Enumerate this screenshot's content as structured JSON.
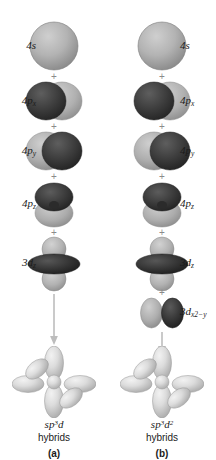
{
  "figure": {
    "plus_symbol": "+",
    "colors": {
      "background": "#ffffff",
      "lobe_light": "#b9b9b9",
      "lobe_dark": "#3a3a3a",
      "hybrid": "#d7d7d7",
      "arrow": "#bdbdbd",
      "text": "#1b1b1b",
      "plus": "#8b8b8b"
    }
  },
  "columns": [
    {
      "id": "a",
      "label_side": "left",
      "panel_letter": "(a)",
      "hybrid_name": "sp",
      "hybrid_sup1": "3",
      "hybrid_tail": "d",
      "hybrid_sup2": "",
      "hybrid_word": "hybrids",
      "orbitals": [
        {
          "name": "4s",
          "sub": "",
          "subsup": "",
          "shape": "s",
          "top": 18
        },
        {
          "name": "4p",
          "sub": "x",
          "subsup": "",
          "shape": "px",
          "top": 78
        },
        {
          "name": "4p",
          "sub": "y",
          "subsup": "",
          "shape": "py",
          "top": 128
        },
        {
          "name": "4p",
          "sub": "z",
          "subsup": "",
          "shape": "pz",
          "top": 180
        },
        {
          "name": "3d",
          "sub": "z",
          "subsup": "2",
          "shape": "dz2",
          "top": 236
        }
      ]
    },
    {
      "id": "b",
      "label_side": "right",
      "panel_letter": "(b)",
      "hybrid_name": "sp",
      "hybrid_sup1": "3",
      "hybrid_tail": "d",
      "hybrid_sup2": "2",
      "hybrid_word": "hybrids",
      "orbitals": [
        {
          "name": "4s",
          "sub": "",
          "subsup": "",
          "shape": "s",
          "top": 18
        },
        {
          "name": "4p",
          "sub": "x",
          "subsup": "",
          "shape": "px",
          "top": 78
        },
        {
          "name": "4p",
          "sub": "y",
          "subsup": "",
          "shape": "py",
          "top": 128
        },
        {
          "name": "4p",
          "sub": "z",
          "subsup": "",
          "shape": "pz",
          "top": 180
        },
        {
          "name": "3d",
          "sub": "z",
          "subsup": "2",
          "shape": "dz2",
          "top": 236
        },
        {
          "name": "3d",
          "sub": "x2−y",
          "subsup": "2",
          "shape": "dx2y2",
          "top": 296
        }
      ]
    }
  ]
}
